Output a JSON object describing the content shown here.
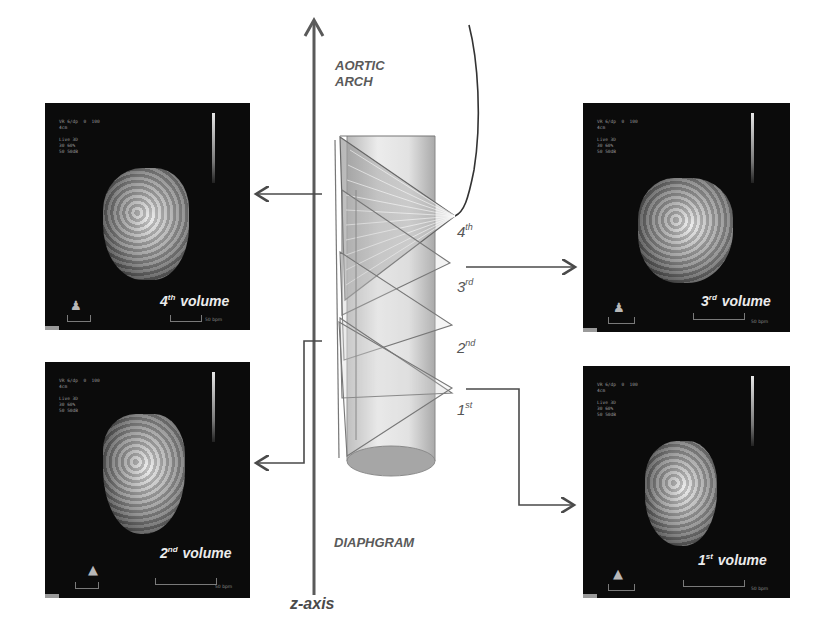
{
  "diagram": {
    "axis": {
      "label": "z-axis",
      "top_label_line1": "AORTIC",
      "top_label_line2": "ARCH",
      "bottom_label": "DIAPHGRAM"
    },
    "sweeps": [
      {
        "num": "4",
        "suffix": "th"
      },
      {
        "num": "3",
        "suffix": "rd"
      },
      {
        "num": "2",
        "suffix": "nd"
      },
      {
        "num": "1",
        "suffix": "st"
      }
    ],
    "panels": {
      "top_left": {
        "num": "4",
        "suffix": "th",
        "word": "volume",
        "hud": "VR 6/dp  0  100\n4cm\n\nLive 3D\n30 60%\n50 50dB",
        "scale": "50 bpm"
      },
      "bottom_left": {
        "num": "2",
        "suffix": "nd",
        "word": "volume",
        "hud": "VR 6/dp  0  100\n4cm\n\nLive 3D\n30 60%\n50 50dB",
        "scale": "50 bpm"
      },
      "top_right": {
        "num": "3",
        "suffix": "rd",
        "word": "volume",
        "hud": "VR 6/dp  0  100\n4cm\n\nLive 3D\n30 60%\n50 50dB",
        "scale": "50 bpm"
      },
      "bottom_right": {
        "num": "1",
        "suffix": "st",
        "word": "volume",
        "hud": "VR 6/dp  0  100\n4cm\n\nLive 3D\n30 60%\n50 50dB",
        "scale": "50 bpm"
      }
    },
    "colors": {
      "line": "#4a4a4a",
      "panel_bg": "#0b0b0b",
      "label_gray": "#5a5a5a",
      "cylinder": "#d8d8d8"
    }
  }
}
